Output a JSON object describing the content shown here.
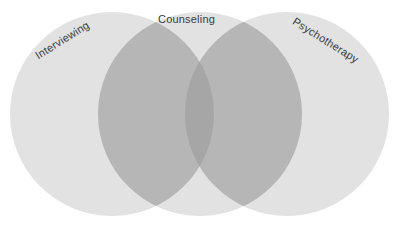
{
  "diagram": {
    "type": "venn",
    "title": "",
    "background_color": "#ffffff",
    "width": 400,
    "height": 228,
    "set_fill_color": "#e2e2e2",
    "overlap_two_color": "#b6b6b6",
    "overlap_three_color": "#a6a6a6",
    "label_color": "#3a3a3a",
    "sets": [
      {
        "id": "interviewing",
        "label": "Interviewing",
        "cx": 112,
        "cy": 114,
        "r": 102,
        "rotation": -32
      },
      {
        "id": "counseling",
        "label": "Counseling",
        "cx": 200,
        "cy": 114,
        "r": 102,
        "rotation": 0
      },
      {
        "id": "psychotherapy",
        "label": "Psychotherapy",
        "cx": 287,
        "cy": 114,
        "r": 102,
        "rotation": 32
      }
    ]
  },
  "chart_data": {
    "type": "venn",
    "title": "",
    "categories": [
      "Interviewing",
      "Counseling",
      "Psychotherapy"
    ],
    "values": [
      1,
      1,
      1
    ],
    "xlabel": "",
    "ylabel": "",
    "legend": [],
    "annotations": [
      "Interviewing",
      "Counseling",
      "Psychotherapy"
    ],
    "grid": false
  }
}
